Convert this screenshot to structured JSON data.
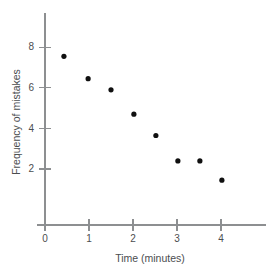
{
  "chart_data": {
    "type": "scatter",
    "title": "",
    "xlabel": "Time (minutes)",
    "ylabel": "Frequency of mistakes",
    "xlim": [
      0,
      5
    ],
    "ylim": [
      0,
      9
    ],
    "xticks": [
      0,
      1,
      2,
      3,
      4
    ],
    "yticks": [
      2,
      4,
      6,
      8
    ],
    "xticklabels": [
      "0",
      "1",
      "2",
      "3",
      "4"
    ],
    "yticklabels": [
      "2",
      "4",
      "6",
      "8"
    ],
    "grid": false,
    "legend": null,
    "marker_color": "#101010",
    "axis_color": "#8d8f91",
    "points": [
      {
        "x": 0.43,
        "y": 7.55
      },
      {
        "x": 0.98,
        "y": 6.45
      },
      {
        "x": 1.5,
        "y": 5.9
      },
      {
        "x": 2.02,
        "y": 4.7
      },
      {
        "x": 2.52,
        "y": 3.65
      },
      {
        "x": 3.02,
        "y": 2.4
      },
      {
        "x": 3.52,
        "y": 2.4
      },
      {
        "x": 4.02,
        "y": 1.45
      }
    ]
  }
}
